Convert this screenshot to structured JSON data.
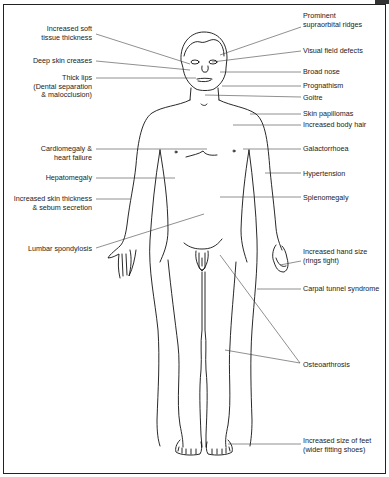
{
  "diagram": {
    "type": "anatomical-annotation",
    "left_labels": [
      {
        "id": "soft-tissue",
        "text": "Increased soft\ntissue thickness",
        "x": 10,
        "y": 25,
        "w": 82,
        "line": [
          96,
          34,
          190,
          64
        ]
      },
      {
        "id": "skin-creases",
        "text": "Deep skin creases",
        "x": 10,
        "y": 57,
        "w": 82,
        "line": [
          96,
          61,
          190,
          70
        ]
      },
      {
        "id": "thick-lips",
        "text": "Thick lips\n(Dental separation\n& malocclusion)",
        "x": 10,
        "y": 74,
        "w": 82,
        "line": [
          96,
          78,
          196,
          78
        ]
      },
      {
        "id": "cardiomegaly",
        "text": "Cardiomegaly &\nheart failure",
        "x": 10,
        "y": 145,
        "w": 82,
        "line": [
          96,
          149,
          207,
          149
        ]
      },
      {
        "id": "hepatomegaly",
        "text": "Hepatomegaly",
        "x": 10,
        "y": 174,
        "w": 82,
        "line": [
          96,
          178,
          175,
          178
        ]
      },
      {
        "id": "skin-thickness",
        "text": "Increased skin thickness\n& sebum secretion",
        "x": 3,
        "y": 195,
        "w": 89,
        "line": [
          96,
          199,
          130,
          199
        ]
      },
      {
        "id": "lumbar",
        "text": "Lumbar spondylosis",
        "x": 10,
        "y": 245,
        "w": 82,
        "line": [
          96,
          248,
          204,
          214
        ]
      }
    ],
    "right_labels": [
      {
        "id": "supraorbital",
        "text": "Prominent\nsupraorbital ridges",
        "x": 303,
        "y": 12,
        "line": [
          301,
          27,
          220,
          55
        ]
      },
      {
        "id": "visual-field",
        "text": "Visual field defects",
        "x": 303,
        "y": 47,
        "line": [
          301,
          51,
          212,
          62
        ]
      },
      {
        "id": "broad-nose",
        "text": "Broad nose",
        "x": 303,
        "y": 68,
        "line": [
          301,
          72,
          220,
          72
        ]
      },
      {
        "id": "prognathism",
        "text": "Prognathism",
        "x": 303,
        "y": 82,
        "line": [
          301,
          86,
          222,
          86
        ]
      },
      {
        "id": "goitre",
        "text": "Goitre",
        "x": 303,
        "y": 94,
        "line": [
          301,
          97,
          205,
          95
        ]
      },
      {
        "id": "skin-papillomas",
        "text": "Skin papillomas",
        "x": 303,
        "y": 110,
        "line": [
          301,
          114,
          250,
          114
        ]
      },
      {
        "id": "body-hair",
        "text": "Increased body hair",
        "x": 303,
        "y": 121,
        "line": [
          301,
          125,
          233,
          125
        ]
      },
      {
        "id": "galactorrhoea",
        "text": "Galactorrhoea",
        "x": 303,
        "y": 145,
        "line": [
          301,
          149,
          243,
          149
        ]
      },
      {
        "id": "hypertension",
        "text": "Hypertension",
        "x": 303,
        "y": 170,
        "line": [
          301,
          173,
          265,
          173
        ]
      },
      {
        "id": "splenomegaly",
        "text": "Splenomegaly",
        "x": 303,
        "y": 194,
        "line": [
          301,
          197,
          220,
          197
        ]
      },
      {
        "id": "hand-size",
        "text": "Increased hand size\n(rings tight)",
        "x": 303,
        "y": 248,
        "line": [
          301,
          261,
          280,
          265
        ]
      },
      {
        "id": "carpal-tunnel",
        "text": "Carpal tunnel syndrome",
        "x": 303,
        "y": 285,
        "line": [
          301,
          289,
          257,
          289
        ]
      },
      {
        "id": "osteoarthrosis",
        "text": "Osteoarthrosis",
        "x": 303,
        "y": 361,
        "line": [
          300,
          363,
          225,
          350
        ]
      },
      {
        "id": "feet",
        "text": "Increased size of feet\n(wider fitting shoes)",
        "x": 303,
        "y": 437,
        "line": [
          301,
          444,
          228,
          444
        ]
      }
    ],
    "extra_lines": [
      {
        "for": "osteoarthrosis",
        "line": [
          300,
          363,
          220,
          255
        ]
      }
    ]
  }
}
